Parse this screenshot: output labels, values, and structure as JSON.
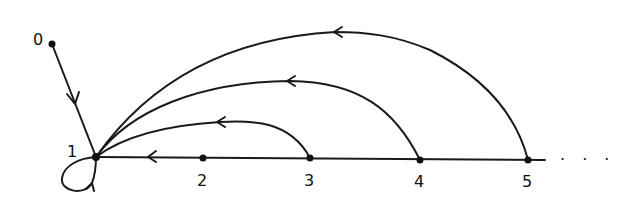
{
  "diagram": {
    "type": "directed-graph",
    "nodes": [
      {
        "id": "0",
        "label": "0"
      },
      {
        "id": "1",
        "label": "1"
      },
      {
        "id": "2",
        "label": "2"
      },
      {
        "id": "3",
        "label": "3"
      },
      {
        "id": "4",
        "label": "4"
      },
      {
        "id": "5",
        "label": "5"
      }
    ],
    "edges": [
      {
        "from": "0",
        "to": "1"
      },
      {
        "from": "1",
        "to": "1"
      },
      {
        "from": "2",
        "to": "1"
      },
      {
        "from": "3",
        "to": "1"
      },
      {
        "from": "4",
        "to": "1"
      },
      {
        "from": "5",
        "to": "1"
      }
    ],
    "continuation": "· · ·",
    "colors": {
      "ink": "#111111",
      "background": "#ffffff"
    }
  }
}
